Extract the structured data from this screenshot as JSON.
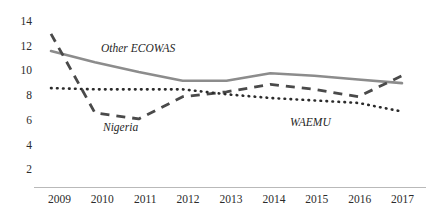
{
  "chart_data": {
    "type": "line",
    "title": "",
    "xlabel": "",
    "ylabel": "",
    "x": [
      2009,
      2010,
      2011,
      2012,
      2013,
      2014,
      2015,
      2016,
      2017
    ],
    "categories": [
      "2009",
      "2010",
      "2011",
      "2012",
      "2013",
      "2014",
      "2015",
      "2016",
      "2017"
    ],
    "ylim": [
      0,
      14
    ],
    "yticks": [
      14,
      12,
      10,
      8,
      6,
      4,
      2
    ],
    "ytick_labels": [
      "14",
      "12",
      "10",
      "8",
      "6",
      "4",
      "2"
    ],
    "xlim": [
      2009,
      2017
    ],
    "grid": false,
    "legend_position": "inline-annotations",
    "series": [
      {
        "name": "Other ECOWAS",
        "style": "solid",
        "color": "#8c8c8c",
        "values": [
          11.6,
          10.7,
          9.9,
          9.2,
          9.2,
          9.8,
          9.6,
          9.3,
          9.0
        ]
      },
      {
        "name": "Nigeria",
        "style": "dashed",
        "color": "#4a4a4a",
        "values": [
          13.0,
          6.6,
          6.1,
          7.9,
          8.3,
          8.9,
          8.5,
          7.9,
          9.6
        ]
      },
      {
        "name": "WAEMU",
        "style": "dotted",
        "color": "#2b2b2b",
        "values": [
          8.6,
          8.5,
          8.5,
          8.5,
          8.1,
          7.8,
          7.6,
          7.4,
          6.7
        ]
      }
    ],
    "annotations": [
      {
        "text": "Other ECOWAS",
        "series": "Other ECOWAS"
      },
      {
        "text": "Nigeria",
        "series": "Nigeria"
      },
      {
        "text": "WAEMU",
        "series": "WAEMU"
      }
    ]
  },
  "axis": {
    "y_labels": [
      "14",
      "12",
      "10",
      "8",
      "6",
      "4",
      "2"
    ],
    "x_labels": [
      "2009",
      "2010",
      "2011",
      "2012",
      "2013",
      "2014",
      "2015",
      "2016",
      "2017"
    ]
  },
  "title_fragment": "."
}
